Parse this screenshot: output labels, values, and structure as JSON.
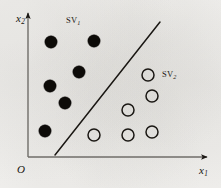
{
  "figure": {
    "kind": "svm-separating-hyperplane-scatter",
    "background_color": "#f4f3f1",
    "ink_color": "#1a1713"
  },
  "axes": {
    "y_label": "x",
    "y_label_sub": "2",
    "x_label": "x",
    "x_label_sub": "1",
    "origin_label": "O",
    "origin_px": [
      28,
      157
    ],
    "y_axis_top_px": [
      28,
      11
    ],
    "x_axis_right_px": [
      210,
      157
    ],
    "grid": false
  },
  "annotations": [
    {
      "name": "sv1",
      "text": "SV",
      "sub": "1",
      "x": 66,
      "y": 16
    },
    {
      "name": "sv2",
      "text": "SV",
      "sub": "2",
      "x": 162,
      "y": 70
    }
  ],
  "separator": {
    "label": "separating-hyperplane",
    "x1": 55,
    "y1": 155,
    "x2": 160,
    "y2": 22,
    "stroke": "#1a1713",
    "width": 1.5
  },
  "chart_data": {
    "type": "scatter",
    "title": "",
    "xlabel": "x1",
    "ylabel": "x2",
    "grid": false,
    "legend_position": "none",
    "series": [
      {
        "name": "class-filled",
        "marker": "filled-circle",
        "color": "#0d0b08",
        "radius": 6.2,
        "points": [
          [
            51,
            42
          ],
          [
            94,
            41
          ],
          [
            79,
            72
          ],
          [
            50,
            86
          ],
          [
            65,
            103
          ],
          [
            45,
            131
          ]
        ]
      },
      {
        "name": "class-open",
        "marker": "open-circle",
        "color": "#1a1713",
        "radius": 6.0,
        "points": [
          [
            148,
            75
          ],
          [
            152,
            96
          ],
          [
            128,
            110
          ],
          [
            152,
            132
          ],
          [
            128,
            135
          ],
          [
            94,
            135
          ]
        ]
      }
    ]
  }
}
